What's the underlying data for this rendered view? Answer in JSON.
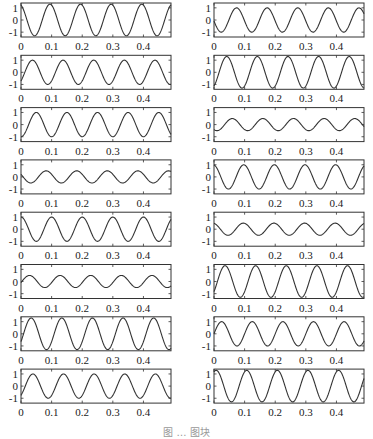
{
  "caption": "图 … 图块",
  "chart_data": {
    "type": "line",
    "layout": "8 rows x 2 columns of subplots",
    "xlim": [
      0,
      0.49
    ],
    "ylim": [
      -1.4,
      1.4
    ],
    "xticks": [
      0,
      0.1,
      0.2,
      0.3,
      0.4
    ],
    "xtick_labels": [
      "0",
      "0.1",
      "0.2",
      "0.3",
      "0.4"
    ],
    "yticks": [
      -1,
      0,
      1
    ],
    "ytick_labels": [
      "-1",
      "0",
      "1"
    ],
    "grid": false,
    "frequency_hz": 10,
    "panels": [
      {
        "column": "left",
        "row": 1,
        "amplitude": 1.3,
        "phase_deg": 20
      },
      {
        "column": "left",
        "row": 2,
        "amplitude": 1.0,
        "phase_deg": -135
      },
      {
        "column": "left",
        "row": 3,
        "amplitude": 1.0,
        "phase_deg": -180
      },
      {
        "column": "left",
        "row": 4,
        "amplitude": 0.5,
        "phase_deg": 65
      },
      {
        "column": "left",
        "row": 5,
        "amplitude": 1.0,
        "phase_deg": 0
      },
      {
        "column": "left",
        "row": 6,
        "amplitude": 0.5,
        "phase_deg": -100
      },
      {
        "column": "left",
        "row": 7,
        "amplitude": 1.3,
        "phase_deg": -120
      },
      {
        "column": "left",
        "row": 8,
        "amplitude": 1.0,
        "phase_deg": -140
      },
      {
        "column": "right",
        "row": 1,
        "amplitude": 1.0,
        "phase_deg": 95
      },
      {
        "column": "right",
        "row": 2,
        "amplitude": 1.3,
        "phase_deg": -150
      },
      {
        "column": "right",
        "row": 3,
        "amplitude": 0.5,
        "phase_deg": -215
      },
      {
        "column": "right",
        "row": 4,
        "amplitude": 1.0,
        "phase_deg": 10
      },
      {
        "column": "right",
        "row": 5,
        "amplitude": 0.5,
        "phase_deg": 15
      },
      {
        "column": "right",
        "row": 6,
        "amplitude": 1.3,
        "phase_deg": -130
      },
      {
        "column": "right",
        "row": 7,
        "amplitude": 1.0,
        "phase_deg": -90
      },
      {
        "column": "right",
        "row": 8,
        "amplitude": 1.3,
        "phase_deg": -25
      }
    ]
  }
}
